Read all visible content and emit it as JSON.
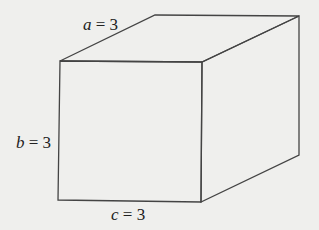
{
  "figure": {
    "type": "rectangular-prism",
    "background": "#efefed",
    "line_color": "#444444",
    "labels": [
      {
        "id": "a",
        "variable": "a",
        "equals": " = ",
        "value": "3",
        "position": "top-left-depth-edge"
      },
      {
        "id": "b",
        "variable": "b",
        "equals": " = ",
        "value": "3",
        "position": "left-vertical-edge"
      },
      {
        "id": "c",
        "variable": "c",
        "equals": " = ",
        "value": "3",
        "position": "bottom-horizontal-edge"
      }
    ]
  }
}
